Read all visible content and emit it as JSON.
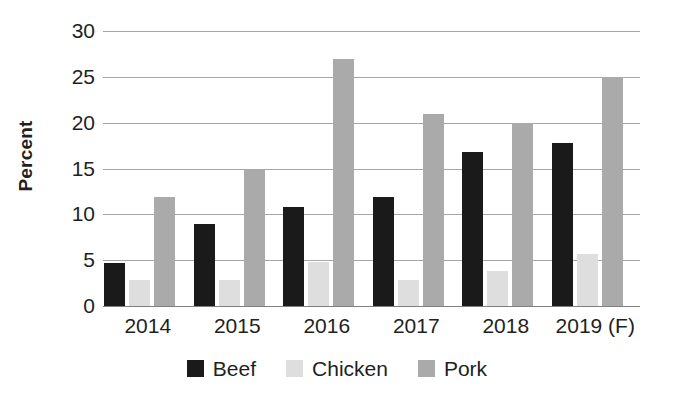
{
  "chart_data": {
    "type": "bar",
    "title": "",
    "xlabel": "",
    "ylabel": "Percent",
    "ylim": [
      0,
      30
    ],
    "yticks": [
      0,
      5,
      10,
      15,
      20,
      25,
      30
    ],
    "ytick_labels": [
      "0",
      "5",
      "10",
      "15",
      "20",
      "25",
      "30"
    ],
    "grid": true,
    "legend_position": "bottom",
    "categories": [
      "2014",
      "2015",
      "2016",
      "2017",
      "2018",
      "2019 (F)"
    ],
    "series": [
      {
        "name": "Beef",
        "color": "#1a1a1a",
        "values": [
          4.7,
          9.0,
          10.8,
          11.9,
          16.8,
          17.8
        ]
      },
      {
        "name": "Chicken",
        "color": "#dedede",
        "values": [
          2.8,
          2.8,
          4.8,
          2.8,
          3.8,
          5.7
        ]
      },
      {
        "name": "Pork",
        "color": "#aaaaaa",
        "values": [
          11.9,
          15.0,
          27.0,
          21.0,
          20.0,
          25.0
        ]
      }
    ]
  },
  "axis": {
    "y_title": "Percent"
  },
  "legend": {
    "items": [
      {
        "label": "Beef"
      },
      {
        "label": "Chicken"
      },
      {
        "label": "Pork"
      }
    ]
  }
}
